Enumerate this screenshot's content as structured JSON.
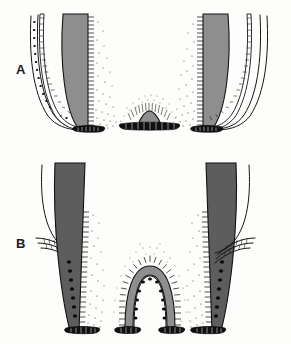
{
  "figure": {
    "background_color": "#fdfdfb",
    "ink_color": "#121212",
    "width": 291,
    "height": 344,
    "panels": [
      {
        "id": "A",
        "label": "A",
        "label_x": 16,
        "label_y": 74,
        "description": "Upper panel: two opposing root walls with a low dome-shaped papilla remnant between them",
        "objects": [
          {
            "name": "left-root-wall",
            "role": "root-wall",
            "side": "left",
            "dentin_tone": "#8e8e8e",
            "has_hatching": true,
            "has_stipple": true,
            "has_epithelial_sheath": true,
            "has_basal_bone_band": true
          },
          {
            "name": "central-papilla-dome",
            "role": "dome",
            "side": "center",
            "dentin_tone": "#6f6f6f",
            "has_hatching": true,
            "has_stipple": true,
            "has_epithelial_sheath": false,
            "has_basal_bone_band": true
          },
          {
            "name": "right-root-wall",
            "role": "root-wall",
            "side": "right",
            "dentin_tone": "#8e8e8e",
            "has_hatching": true,
            "has_stipple": true,
            "has_epithelial_sheath": true,
            "has_basal_bone_band": true
          }
        ]
      },
      {
        "id": "B",
        "label": "B",
        "label_x": 16,
        "label_y": 248,
        "description": "Lower panel: two elongated root walls with detached epithelial sheath strands and a tall arch-shaped papilla between them; chains of epithelial rest cells line the root surfaces",
        "objects": [
          {
            "name": "left-root-wall",
            "role": "root-wall",
            "side": "left",
            "dentin_tone": "#5d5d5d",
            "has_hatching": true,
            "has_stipple": true,
            "has_epithelial_sheath": true,
            "has_rest-cell-chain": true,
            "has_basal_bone_band": true
          },
          {
            "name": "central-papilla-arch",
            "role": "arch",
            "side": "center",
            "dentin_tone": "#8a8a8a",
            "has_hatching": true,
            "has_stipple": true,
            "has_rest-cell-chain": true,
            "has_basal_bone_band": true
          },
          {
            "name": "right-root-wall",
            "role": "root-wall",
            "side": "right",
            "dentin_tone": "#5d5d5d",
            "has_hatching": true,
            "has_stipple": true,
            "has_epithelial_sheath": true,
            "has_rest-cell-chain": true,
            "has_basal_bone_band": true
          }
        ]
      }
    ]
  }
}
